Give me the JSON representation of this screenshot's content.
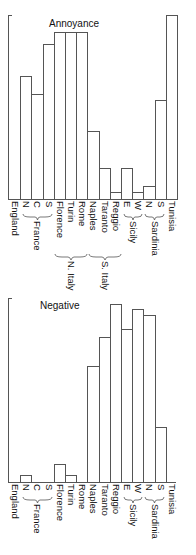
{
  "chart_data": [
    {
      "type": "bar",
      "title": "Annoyance",
      "categories": [
        "England",
        "N",
        "C",
        "S",
        "Florence",
        "Turin",
        "Rome",
        "Naples",
        "Taranto",
        "Reggio",
        "E",
        "W",
        "N",
        "S",
        "Tunisia"
      ],
      "values": [
        0,
        67,
        57,
        84,
        91,
        91,
        91,
        37,
        17,
        4,
        17,
        4,
        7,
        54,
        100
      ],
      "groups": [
        {
          "label": "France",
          "members": [
            "N",
            "C",
            "S"
          ]
        },
        {
          "label": "N. Italy",
          "members": [
            "Florence",
            "Turin",
            "Rome"
          ]
        },
        {
          "label": "S. Italy",
          "members": [
            "Naples",
            "Taranto",
            "Reggio"
          ]
        },
        {
          "label": "Sicily",
          "members": [
            "E",
            "W"
          ]
        },
        {
          "label": "Sardinia",
          "members": [
            "N",
            "S"
          ]
        }
      ],
      "xlabel": "",
      "ylabel": "",
      "ylim": [
        0,
        100
      ],
      "grid": false,
      "legend": null
    },
    {
      "type": "bar",
      "title": "Negative",
      "categories": [
        "England",
        "N",
        "C",
        "S",
        "Florence",
        "Turin",
        "Rome",
        "Naples",
        "Taranto",
        "Reggio",
        "E",
        "W",
        "N",
        "S",
        "Tunisia"
      ],
      "values": [
        0,
        4,
        0,
        0,
        10,
        4,
        0,
        63,
        79,
        97,
        83,
        94,
        91,
        30,
        0
      ],
      "groups": [
        {
          "label": "France",
          "members": [
            "N",
            "C",
            "S"
          ]
        },
        {
          "label": "Sicily",
          "members": [
            "E",
            "W"
          ]
        },
        {
          "label": "Sardinia",
          "members": [
            "N",
            "S"
          ]
        }
      ],
      "xlabel": "",
      "ylabel": "",
      "ylim": [
        0,
        100
      ],
      "grid": false,
      "legend": null
    }
  ],
  "charts": {
    "top": {
      "title": "Annoyance",
      "labels": [
        "England",
        "N",
        "C",
        "S",
        "Florence",
        "Turin",
        "Rome",
        "Naples",
        "Taranto",
        "Reggio",
        "E",
        "W",
        "N",
        "S",
        "Tunisia"
      ],
      "groups": {
        "france": "France",
        "n_italy": "N. Italy",
        "s_italy": "S. Italy",
        "sicily": "Sicily",
        "sardinia": "Sardinia"
      }
    },
    "bottom": {
      "title": "Negative",
      "labels": [
        "England",
        "N",
        "C",
        "S",
        "Florence",
        "Turin",
        "Rome",
        "Naples",
        "Taranto",
        "Reggio",
        "E",
        "W",
        "N",
        "S",
        "Tunisia"
      ],
      "groups": {
        "france": "France",
        "sicily": "Sicily",
        "sardinia": "Sardinia"
      }
    }
  }
}
